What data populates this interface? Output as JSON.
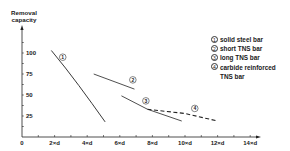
{
  "chart_data": {
    "type": "line",
    "title": "",
    "ylabel": "Removal capacity",
    "xlabel": "",
    "xlim": [
      0,
      14
    ],
    "ylim": [
      0,
      110
    ],
    "grid": false,
    "legend_position": "upper right",
    "x_ticks": [
      {
        "value": 0,
        "label": "0"
      },
      {
        "value": 2,
        "label": "2×d"
      },
      {
        "value": 4,
        "label": "4×d"
      },
      {
        "value": 6,
        "label": "6×d"
      },
      {
        "value": 8,
        "label": "8×d"
      },
      {
        "value": 10,
        "label": "10×d"
      },
      {
        "value": 12,
        "label": "12×d"
      },
      {
        "value": 14,
        "label": "14×d"
      }
    ],
    "y_ticks": [
      {
        "value": 25,
        "label": "25"
      },
      {
        "value": 50,
        "label": "50"
      },
      {
        "value": 75,
        "label": "75"
      },
      {
        "value": 100,
        "label": "100"
      }
    ],
    "series": [
      {
        "id": "1",
        "name": "solid steel bar",
        "style": "solid",
        "points": [
          [
            1.8,
            103
          ],
          [
            3.0,
            75
          ],
          [
            4.0,
            48
          ],
          [
            5.1,
            18
          ]
        ]
      },
      {
        "id": "2",
        "name": "short TNS bar",
        "style": "solid",
        "points": [
          [
            4.4,
            75
          ],
          [
            6.9,
            57
          ]
        ]
      },
      {
        "id": "3",
        "name": "long TNS bar",
        "style": "solid",
        "points": [
          [
            6.1,
            49
          ],
          [
            7.7,
            33
          ],
          [
            9.8,
            19
          ]
        ]
      },
      {
        "id": "4",
        "name": "carbide reinforced TNS bar",
        "style": "dashed",
        "points": [
          [
            7.7,
            33
          ],
          [
            10.0,
            28
          ],
          [
            12.0,
            19
          ]
        ]
      }
    ]
  },
  "labels": {
    "ylabel_line1": "Removal",
    "ylabel_line2": "capacity"
  },
  "legend": [
    {
      "num": "1",
      "text": "solid steel bar"
    },
    {
      "num": "2",
      "text": "short TNS bar"
    },
    {
      "num": "3",
      "text": "long TNS bar"
    },
    {
      "num": "4",
      "text": "carbide reinforced",
      "text2": "TNS bar"
    }
  ]
}
